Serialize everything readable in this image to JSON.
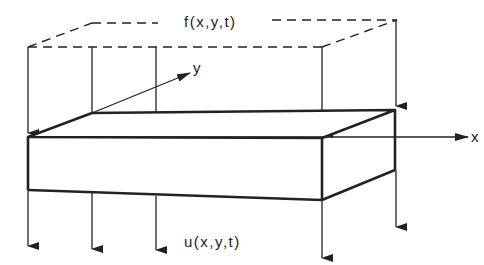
{
  "figure": {
    "labels": {
      "load": "f(x,y,t)",
      "response": "u(x,y,t)",
      "x_axis": "x",
      "y_axis": "y"
    },
    "colors": {
      "stroke": "#222222",
      "background": "#ffffff"
    },
    "load_arrows_count": 5,
    "response_arrows_count": 5
  }
}
